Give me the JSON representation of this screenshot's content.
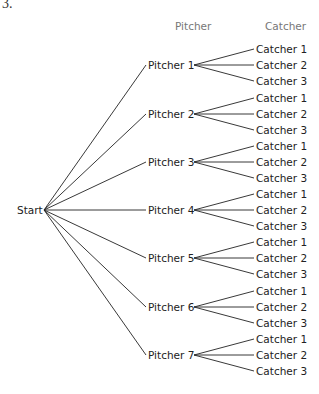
{
  "problem_number": "3.",
  "headers": {
    "pitcher": "Pitcher",
    "catcher": "Catcher"
  },
  "root": "Start",
  "pitchers": [
    "Pitcher 1",
    "Pitcher 2",
    "Pitcher 3",
    "Pitcher 4",
    "Pitcher 5",
    "Pitcher 6",
    "Pitcher 7"
  ],
  "catchers": [
    "Catcher 1",
    "Catcher 2",
    "Catcher 3"
  ]
}
